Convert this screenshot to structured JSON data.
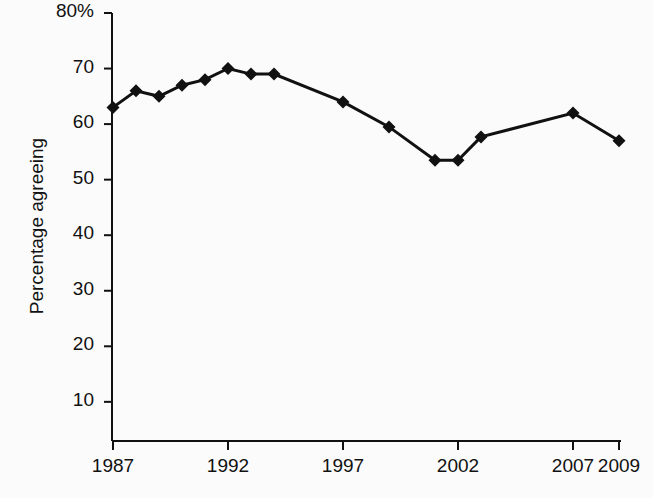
{
  "chart_data": {
    "type": "line",
    "title": "",
    "subtitle": "",
    "xlabel": "",
    "ylabel": "Percentage agreeing",
    "xlim": [
      1986,
      2009.5
    ],
    "ylim": [
      0,
      80
    ],
    "grid": false,
    "legend": null,
    "marker": "diamond",
    "line_color": "#111111",
    "marker_color": "#111111",
    "x": [
      1987,
      1988,
      1989,
      1990,
      1991,
      1992,
      1993,
      1994,
      1997,
      1999,
      2001,
      2002,
      2003,
      2007,
      2009
    ],
    "values": [
      63,
      66,
      65,
      67,
      68,
      70,
      69,
      69,
      64,
      59.5,
      53.5,
      53.5,
      57.7,
      62,
      57
    ],
    "series": [
      {
        "name": "Percentage agreeing",
        "x": [
          1987,
          1988,
          1989,
          1990,
          1991,
          1992,
          1993,
          1994,
          1997,
          1999,
          2001,
          2002,
          2003,
          2007,
          2009
        ],
        "values": [
          63,
          66,
          65,
          67,
          68,
          70,
          69,
          69,
          64,
          59.5,
          53.5,
          53.5,
          57.7,
          62,
          57
        ]
      }
    ],
    "y_ticks": [
      10,
      20,
      30,
      40,
      50,
      60,
      70,
      80
    ],
    "y_tick_labels": [
      "10",
      "20",
      "30",
      "40",
      "50",
      "60",
      "70",
      "80%"
    ],
    "x_ticks": [
      1987,
      1992,
      1997,
      2002,
      2007,
      2009
    ],
    "x_tick_labels": [
      "1987",
      "1992",
      "1997",
      "2002",
      "2007",
      "2009"
    ]
  }
}
